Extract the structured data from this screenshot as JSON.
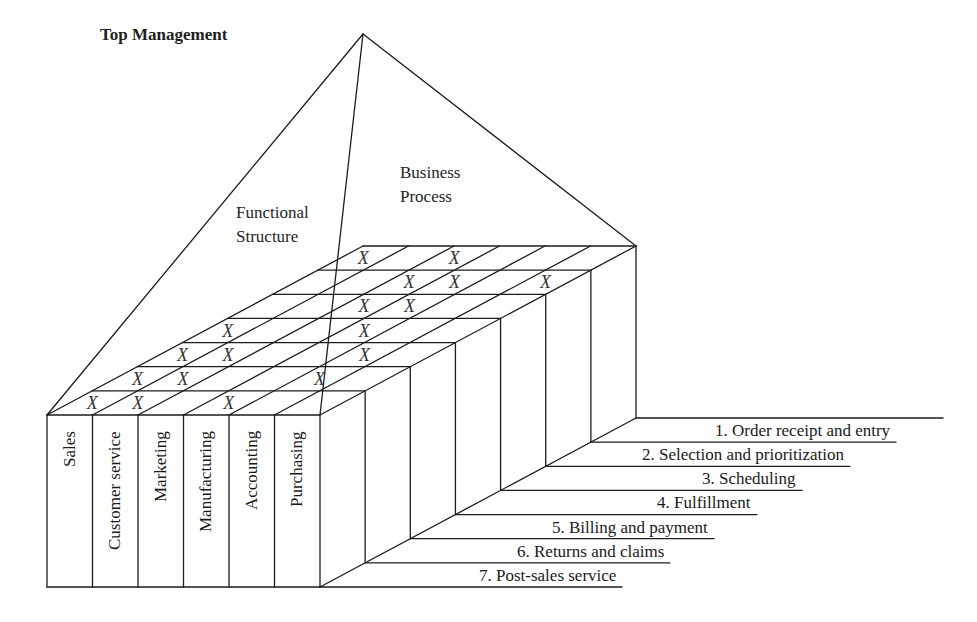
{
  "title": "Top Management",
  "faces": {
    "functional": [
      "Functional",
      "Structure"
    ],
    "process": [
      "Business",
      "Process"
    ]
  },
  "functions": [
    "Sales",
    "Customer service",
    "Marketing",
    "Manufacturing",
    "Accounting",
    "Purchasing"
  ],
  "processes": [
    "1. Order receipt and entry",
    "2. Selection and prioritization",
    "3. Scheduling",
    "4. Fulfillment",
    "5. Billing and payment",
    "6. Returns and claims",
    "7. Post-sales service"
  ],
  "mark_symbol": "X",
  "matrix": {
    "description": "rows = processes 1..7, columns = functions in order; 1 = X mark",
    "rows": [
      [
        1,
        0,
        1,
        0,
        0,
        0
      ],
      [
        0,
        0,
        1,
        1,
        0,
        1
      ],
      [
        0,
        0,
        1,
        1,
        0,
        0
      ],
      [
        1,
        0,
        0,
        1,
        0,
        0
      ],
      [
        1,
        1,
        0,
        0,
        1,
        0
      ],
      [
        1,
        1,
        0,
        0,
        1,
        0
      ],
      [
        1,
        1,
        0,
        1,
        0,
        0
      ]
    ]
  },
  "colors": {
    "line": "#1c1c1c",
    "text": "#1e1e1e",
    "background": "#ffffff"
  }
}
